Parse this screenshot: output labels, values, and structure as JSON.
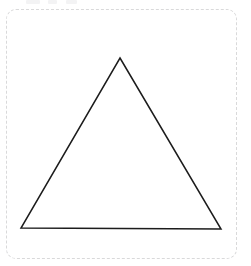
{
  "canvas": {
    "width": 251,
    "height": 266,
    "background_color": "#ffffff",
    "frame": {
      "name": "dashed-canvas-frame",
      "style": "dashed",
      "color": "#d9d9da",
      "corner_radius": 10,
      "x": 6,
      "y": 9,
      "width": 231,
      "height": 250
    }
  },
  "top_remnants": [
    {
      "x": 26,
      "y": 0,
      "width": 14,
      "height": 4
    },
    {
      "x": 48,
      "y": 0,
      "width": 9,
      "height": 4
    },
    {
      "x": 66,
      "y": 0,
      "width": 11,
      "height": 4
    }
  ],
  "shape": {
    "name": "triangle",
    "type": "polygon",
    "sides": 3,
    "fill": "none",
    "stroke_color": "#1c1c1c",
    "stroke_width": 1.5,
    "points": "120,58 221,229 21,228",
    "vertices": [
      {
        "label": "apex",
        "x": 120,
        "y": 58
      },
      {
        "label": "bottom-right",
        "x": 221,
        "y": 229
      },
      {
        "label": "bottom-left",
        "x": 21,
        "y": 228
      }
    ]
  }
}
